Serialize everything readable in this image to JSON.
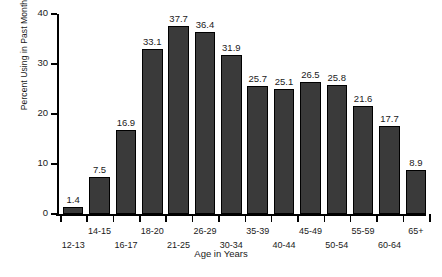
{
  "chart_data": {
    "type": "bar",
    "title": "",
    "xlabel": "Age in Years",
    "ylabel": "Percent Using in Past Month",
    "categories": [
      "12-13",
      "14-15",
      "16-17",
      "18-20",
      "21-25",
      "26-29",
      "30-34",
      "35-39",
      "40-44",
      "45-49",
      "50-54",
      "55-59",
      "60-64",
      "65+"
    ],
    "values": [
      1.4,
      7.5,
      16.9,
      33.1,
      37.7,
      36.4,
      31.9,
      25.7,
      25.1,
      26.5,
      25.8,
      21.6,
      17.7,
      8.9
    ],
    "value_labels": [
      "1.4",
      "7.5",
      "16.9",
      "33.1",
      "37.7",
      "36.4",
      "31.9",
      "25.7",
      "25.1",
      "26.5",
      "25.8",
      "21.6",
      "17.7",
      "8.9"
    ],
    "ylim": [
      0,
      40
    ],
    "yticks": [
      0,
      10,
      20,
      30,
      40
    ],
    "ytick_labels": [
      "0",
      "10",
      "20",
      "30",
      "40"
    ],
    "grid": false,
    "legend": null,
    "bar_color": "#3a3a3a",
    "bar_edge_color": "#000000",
    "background_color": "#ffffff"
  }
}
